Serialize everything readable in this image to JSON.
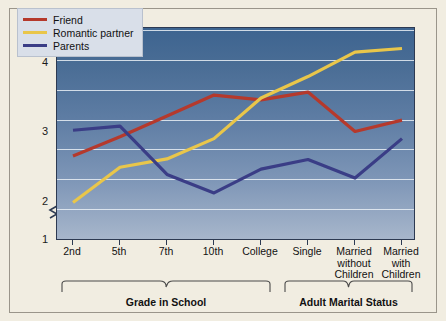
{
  "chart_data": {
    "type": "line",
    "title": "",
    "xlabel": "",
    "ylabel": "Mean Self-Disclosure Score",
    "categories": [
      "2nd",
      "5th",
      "7th",
      "10th",
      "College",
      "Single",
      "Married without Children",
      "Married with Children"
    ],
    "ylim": [
      1,
      5
    ],
    "yticks": [
      1,
      2,
      3,
      4,
      5
    ],
    "grid": true,
    "axis_break": true,
    "legend_position": "top-left",
    "series": [
      {
        "name": "Friend",
        "color": "#b5392c",
        "values": [
          2.89,
          3.21,
          3.56,
          3.91,
          3.83,
          3.96,
          3.3,
          3.49
        ]
      },
      {
        "name": "Romantic partner",
        "color": "#e9c64a",
        "values": [
          2.11,
          2.7,
          2.84,
          3.18,
          3.86,
          4.22,
          4.63,
          4.69
        ]
      },
      {
        "name": "Parents",
        "color": "#3a3d86",
        "values": [
          3.32,
          3.39,
          2.58,
          2.27,
          2.67,
          2.83,
          2.52,
          3.18
        ]
      }
    ],
    "groups": [
      {
        "label": "Grade in School",
        "categories": [
          "2nd",
          "5th",
          "7th",
          "10th",
          "College"
        ]
      },
      {
        "label": "Adult Marital Status",
        "categories": [
          "Single",
          "Married without Children",
          "Married with Children"
        ]
      }
    ]
  },
  "axis": {
    "y_labels": [
      "5",
      "4",
      "3",
      "2",
      "1"
    ],
    "y_title": "Mean Self-Disclosure Score",
    "x_labels": [
      {
        "line1": "2nd",
        "line2": "",
        "line3": ""
      },
      {
        "line1": "5th",
        "line2": "",
        "line3": ""
      },
      {
        "line1": "7th",
        "line2": "",
        "line3": ""
      },
      {
        "line1": "10th",
        "line2": "",
        "line3": ""
      },
      {
        "line1": "College",
        "line2": "",
        "line3": ""
      },
      {
        "line1": "Single",
        "line2": "",
        "line3": ""
      },
      {
        "line1": "Married",
        "line2": "without",
        "line3": "Children"
      },
      {
        "line1": "Married",
        "line2": "with",
        "line3": "Children"
      }
    ]
  },
  "legend": {
    "items": [
      {
        "label": "Friend",
        "color": "#b5392c"
      },
      {
        "label": "Romantic partner",
        "color": "#e9c64a"
      },
      {
        "label": "Parents",
        "color": "#3a3d86"
      }
    ]
  },
  "groups": {
    "grade": "Grade in School",
    "marital": "Adult Marital Status"
  },
  "colors": {
    "friend": "#b5392c",
    "romantic": "#e9c64a",
    "parents": "#3a3d86",
    "page_background": "#f1ede1",
    "plot_top": "#3d6490",
    "plot_bottom": "#a7b6cb",
    "gridline": "#e9eef5",
    "legend_background": "#d9dfe9"
  }
}
